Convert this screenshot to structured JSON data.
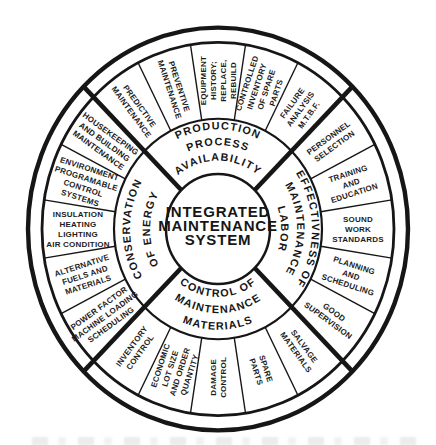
{
  "figure": {
    "type": "wheel-diagram",
    "center": {
      "lines": [
        "INTEGRATED",
        "MAINTENANCE",
        "SYSTEM"
      ]
    },
    "quadrants": [
      {
        "id": "production-process-availability",
        "position": "top",
        "label_lines": [
          "PRODUCTION",
          "PROCESS",
          "AVAILABILITY"
        ],
        "segments": [
          {
            "id": "predictive-maintenance",
            "lines": [
              "PREDICTIVE",
              "MAINTENANCE"
            ]
          },
          {
            "id": "preventive-maintenance",
            "lines": [
              "PREVENTIVE",
              "MAINTENANCE"
            ]
          },
          {
            "id": "equipment-history-replace-rebuild",
            "lines": [
              "EQUIPMENT",
              "HISTORY;",
              "REPLACE,",
              "REBUILD"
            ]
          },
          {
            "id": "controlled-inventory-of-spare-parts",
            "lines": [
              "CONTROLLED",
              "INVENTORY",
              "OF SPARE",
              "PARTS"
            ]
          },
          {
            "id": "failure-analysis-mtbf",
            "lines": [
              "FAILURE",
              "ANALYSIS",
              "M.T.B.F."
            ]
          }
        ]
      },
      {
        "id": "effectivness-of-maintenance-labor",
        "position": "right",
        "label_lines": [
          "EFFECTIVNESS OF",
          "MAINTENANCE",
          "LABOR"
        ],
        "segments": [
          {
            "id": "personnel-selection",
            "lines": [
              "PERSONNEL",
              "SELECTION"
            ]
          },
          {
            "id": "training-and-education",
            "lines": [
              "TRAINING",
              "AND",
              "EDUCATION"
            ]
          },
          {
            "id": "sound-work-standards",
            "lines": [
              "SOUND",
              "WORK",
              "STANDARDS"
            ]
          },
          {
            "id": "planning-and-scheduling",
            "lines": [
              "PLANNING",
              "AND",
              "SCHEDULING"
            ]
          },
          {
            "id": "good-supervision",
            "lines": [
              "GOOD",
              "SUPERVISION"
            ]
          }
        ]
      },
      {
        "id": "control-of-maintenance-materials",
        "position": "bottom",
        "label_lines": [
          "CONTROL OF",
          "MAINTENANCE",
          "MATERIALS"
        ],
        "segments": [
          {
            "id": "salvage-materials",
            "lines": [
              "SALVAGE",
              "MATERIALS"
            ]
          },
          {
            "id": "spare-parts",
            "lines": [
              "SPARE",
              "PARTS"
            ]
          },
          {
            "id": "damage-control",
            "lines": [
              "DAMAGE",
              "CONTROL"
            ]
          },
          {
            "id": "economic-lot-size-and-order-quantity",
            "lines": [
              "ECONOMIC",
              "LOT SIZE",
              "AND ORDER",
              "QUANTITY"
            ]
          },
          {
            "id": "inventory-control",
            "lines": [
              "INVENTORY",
              "CONTROL"
            ]
          }
        ]
      },
      {
        "id": "conservation-of-energy",
        "position": "left",
        "label_lines": [
          "CONSERVATION",
          "OF ENERGY"
        ],
        "segments": [
          {
            "id": "power-factor-machine-loading-scheduling",
            "lines": [
              "POWER FACTOR",
              "MACHINE LOADING",
              "SCHEDULING"
            ]
          },
          {
            "id": "alternative-fuels-and-materials",
            "lines": [
              "ALTERNATIVE",
              "FUELS AND",
              "MATERIALS"
            ]
          },
          {
            "id": "insulation-heating-lighting-air-condition",
            "lines": [
              "INSULATION",
              "HEATING",
              "LIGHTING",
              "AIR CONDITION"
            ]
          },
          {
            "id": "environment-programable-control-systems",
            "lines": [
              "ENVIRONMENT",
              "PROGRAMABLE",
              "CONTROL",
              "SYSTEMS"
            ]
          },
          {
            "id": "housekeeping-and-building-maintenance",
            "lines": [
              "HOUSEKEEPING",
              "AND BUILDING",
              "MAINTENANCE"
            ]
          }
        ]
      }
    ]
  },
  "colors": {
    "ink": "#161616",
    "paper": "#ffffff"
  }
}
